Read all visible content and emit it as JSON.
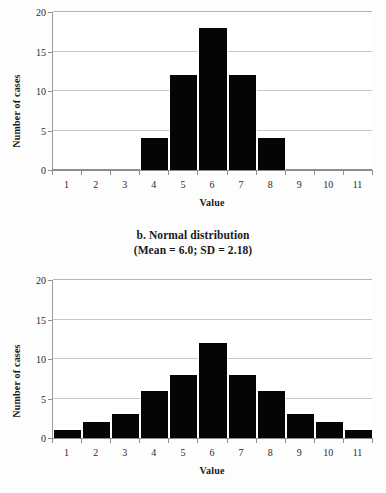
{
  "caption": {
    "line1": "b. Normal distribution",
    "line2": "(Mean = 6.0; SD = 2.18)"
  },
  "colors": {
    "bar": "#050505",
    "gridline": "#c8c8c8",
    "axis": "#8d8d8d",
    "plot_background": "#ffffff",
    "page_background": "#fdfdfd"
  },
  "chart_data": [
    {
      "id": "top",
      "type": "bar",
      "title": "",
      "xlabel": "Value",
      "ylabel": "Number of cases",
      "categories": [
        1,
        2,
        3,
        4,
        5,
        6,
        7,
        8,
        9,
        10,
        11
      ],
      "values": [
        0,
        0,
        0,
        4,
        12,
        18,
        12,
        4,
        0,
        0,
        0
      ],
      "xtick_labels": [
        "1",
        "2",
        "3",
        "4",
        "5",
        "6",
        "7",
        "8",
        "9",
        "10",
        "11"
      ],
      "ytick_labels": [
        "0",
        "5",
        "10",
        "15",
        "20"
      ],
      "yticks": [
        0,
        5,
        10,
        15,
        20
      ],
      "ylim": [
        0,
        20
      ],
      "xlim": [
        0.5,
        11.5
      ],
      "grid": true,
      "legend": null
    },
    {
      "id": "bottom",
      "type": "bar",
      "title": "b. Normal distribution (Mean = 6.0; SD = 2.18)",
      "xlabel": "Value",
      "ylabel": "Number of cases",
      "categories": [
        1,
        2,
        3,
        4,
        5,
        6,
        7,
        8,
        9,
        10,
        11
      ],
      "values": [
        1,
        2,
        3,
        6,
        8,
        12,
        8,
        6,
        3,
        2,
        1
      ],
      "xtick_labels": [
        "1",
        "2",
        "3",
        "4",
        "5",
        "6",
        "7",
        "8",
        "9",
        "10",
        "11"
      ],
      "ytick_labels": [
        "0",
        "5",
        "10",
        "15",
        "20"
      ],
      "yticks": [
        0,
        5,
        10,
        15,
        20
      ],
      "ylim": [
        0,
        20
      ],
      "xlim": [
        0.5,
        11.5
      ],
      "grid": true,
      "legend": null
    }
  ]
}
